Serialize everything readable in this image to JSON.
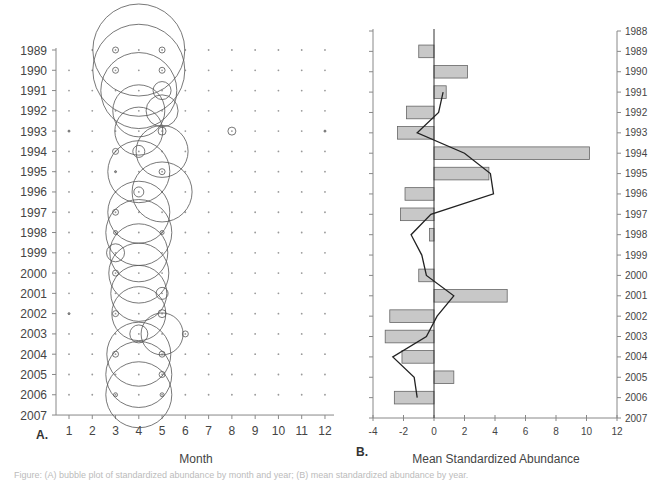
{
  "figure": {
    "caption": "Figure: (A) bubble plot of standardized abundance by month and year; (B) mean standardized abundance by year."
  },
  "chart_data": [
    {
      "id": "A",
      "type": "scatter",
      "subtype": "bubble",
      "panel_label": "A.",
      "title": "",
      "xlabel": "Month",
      "ylabel": "",
      "x_ticks": [
        "1",
        "2",
        "3",
        "4",
        "5",
        "6",
        "7",
        "8",
        "9",
        "10",
        "11",
        "12"
      ],
      "y_ticks": [
        "1989",
        "1990",
        "1991",
        "1992",
        "1993",
        "1994",
        "1995",
        "1996",
        "1997",
        "1998",
        "1999",
        "2000",
        "2001",
        "2002",
        "2003",
        "2004",
        "2005",
        "2006",
        "2007"
      ],
      "xlim": [
        0.5,
        12.5
      ],
      "ylim": [
        "1989",
        "2007"
      ],
      "y_inverted": true,
      "grid": false,
      "background_dot_color": "#999999",
      "circle_color": "#555555",
      "bubbles": [
        {
          "year": 1989,
          "month": 4,
          "r": 46
        },
        {
          "year": 1989,
          "month": 3,
          "r": 3
        },
        {
          "year": 1989,
          "month": 5,
          "r": 3
        },
        {
          "year": 1990,
          "month": 4,
          "r": 46
        },
        {
          "year": 1990,
          "month": 3,
          "r": 3
        },
        {
          "year": 1990,
          "month": 5,
          "r": 3
        },
        {
          "year": 1991,
          "month": 4,
          "r": 38
        },
        {
          "year": 1991,
          "month": 5,
          "r": 9
        },
        {
          "year": 1992,
          "month": 4,
          "r": 26
        },
        {
          "year": 1992,
          "month": 5,
          "r": 16
        },
        {
          "year": 1993,
          "month": 4,
          "r": 24
        },
        {
          "year": 1993,
          "month": 5,
          "r": 4
        },
        {
          "year": 1993,
          "month": 8,
          "r": 4
        },
        {
          "year": 1993,
          "month": 1,
          "r": 1
        },
        {
          "year": 1993,
          "month": 12,
          "r": 1
        },
        {
          "year": 1994,
          "month": 5,
          "r": 26
        },
        {
          "year": 1994,
          "month": 4,
          "r": 6
        },
        {
          "year": 1994,
          "month": 3,
          "r": 3
        },
        {
          "year": 1995,
          "month": 4,
          "r": 31
        },
        {
          "year": 1995,
          "month": 5,
          "r": 3
        },
        {
          "year": 1995,
          "month": 3,
          "r": 1
        },
        {
          "year": 1996,
          "month": 5,
          "r": 30
        },
        {
          "year": 1996,
          "month": 4,
          "r": 5
        },
        {
          "year": 1997,
          "month": 4,
          "r": 31
        },
        {
          "year": 1997,
          "month": 3,
          "r": 3
        },
        {
          "year": 1998,
          "month": 4,
          "r": 33
        },
        {
          "year": 1998,
          "month": 3,
          "r": 2
        },
        {
          "year": 1998,
          "month": 5,
          "r": 2
        },
        {
          "year": 1999,
          "month": 4,
          "r": 29
        },
        {
          "year": 1999,
          "month": 3,
          "r": 9
        },
        {
          "year": 2000,
          "month": 4,
          "r": 30
        },
        {
          "year": 2000,
          "month": 3,
          "r": 3
        },
        {
          "year": 2001,
          "month": 4,
          "r": 28
        },
        {
          "year": 2001,
          "month": 5,
          "r": 6
        },
        {
          "year": 2002,
          "month": 4,
          "r": 27
        },
        {
          "year": 2002,
          "month": 3,
          "r": 3
        },
        {
          "year": 2002,
          "month": 5,
          "r": 4
        },
        {
          "year": 2002,
          "month": 1,
          "r": 1
        },
        {
          "year": 2003,
          "month": 5,
          "r": 21
        },
        {
          "year": 2003,
          "month": 4,
          "r": 9
        },
        {
          "year": 2003,
          "month": 6,
          "r": 3
        },
        {
          "year": 2004,
          "month": 4,
          "r": 32
        },
        {
          "year": 2004,
          "month": 3,
          "r": 3
        },
        {
          "year": 2004,
          "month": 5,
          "r": 3
        },
        {
          "year": 2005,
          "month": 4,
          "r": 33
        },
        {
          "year": 2005,
          "month": 5,
          "r": 3
        },
        {
          "year": 2006,
          "month": 4,
          "r": 33
        },
        {
          "year": 2006,
          "month": 3,
          "r": 2
        },
        {
          "year": 2006,
          "month": 5,
          "r": 2
        }
      ]
    },
    {
      "id": "B",
      "type": "bar",
      "orientation": "horizontal",
      "panel_label": "B.",
      "title": "",
      "xlabel": "Mean Standardized Abundance",
      "ylabel": "",
      "x_ticks": [
        "-4",
        "-2",
        "0",
        "2",
        "4",
        "6",
        "8",
        "10",
        "12"
      ],
      "y_ticks": [
        "1988",
        "1989",
        "1990",
        "1991",
        "1992",
        "1993",
        "1994",
        "1995",
        "1996",
        "1997",
        "1998",
        "1999",
        "2000",
        "2001",
        "2002",
        "2003",
        "2004",
        "2005",
        "2006",
        "2007"
      ],
      "xlim": [
        -4,
        12
      ],
      "ylim": [
        1988,
        2007
      ],
      "y_inverted": true,
      "grid": false,
      "bar_color": "#c8c8c8",
      "bar_edge_color": "#666666",
      "line_color": "#222222",
      "categories": [
        "1989",
        "1990",
        "1991",
        "1992",
        "1993",
        "1994",
        "1995",
        "1996",
        "1997",
        "1998",
        "1999",
        "2000",
        "2001",
        "2002",
        "2003",
        "2004",
        "2005",
        "2006"
      ],
      "series": [
        {
          "name": "Mean standardized abundance (bars)",
          "type": "bar",
          "values": [
            -1.0,
            2.2,
            0.8,
            -1.8,
            -2.4,
            10.2,
            3.6,
            -1.9,
            -2.2,
            -0.3,
            0.0,
            -1.0,
            4.8,
            -2.9,
            -3.2,
            -2.1,
            1.3,
            -2.6
          ]
        },
        {
          "name": "Smoothed trend (line)",
          "type": "line",
          "years": [
            1991,
            1992,
            1993,
            1994,
            1995,
            1996,
            1997,
            1998,
            1999,
            2000,
            2001,
            2002,
            2003,
            2004,
            2005,
            2006
          ],
          "values": [
            0.6,
            0.3,
            -1.1,
            2.0,
            3.7,
            3.9,
            -0.2,
            -1.5,
            -0.8,
            -0.5,
            1.3,
            0.2,
            -0.5,
            -2.7,
            -1.3,
            -1.1
          ]
        }
      ]
    }
  ]
}
